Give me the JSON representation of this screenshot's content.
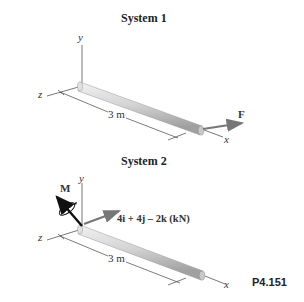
{
  "system1": {
    "title": "System 1",
    "axis_labels": {
      "y": "y",
      "z": "z",
      "x": "x"
    },
    "dimension": "3 m",
    "force_label": "F"
  },
  "system2": {
    "title": "System 2",
    "axis_labels": {
      "y": "y",
      "z": "z",
      "x": "x"
    },
    "dimension": "3 m",
    "moment_label": "M",
    "force_label": "4i + 4j – 2k (kN)"
  },
  "problem_number": "P4.151",
  "colors": {
    "rod_light": "#e6e6e6",
    "rod_dark": "#a8a8a8",
    "arrow": "#7a7a7a",
    "moment_arrow": "#111111",
    "line": "#555555"
  }
}
